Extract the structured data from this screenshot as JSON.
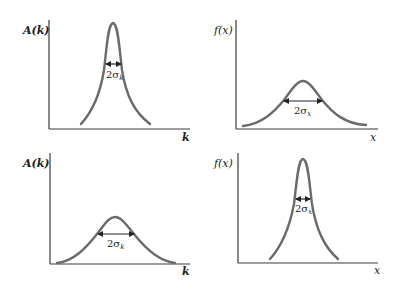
{
  "figure": {
    "curve_color": "#6a6a6a",
    "axis_color": "#3a3a3a",
    "panels": [
      {
        "id": "top-left",
        "y_label": "A(k)",
        "x_label": "k",
        "width_label_main": "2σ",
        "width_label_sub": "k",
        "shape": "narrow"
      },
      {
        "id": "top-right",
        "y_label": "f(x)",
        "x_label": "x",
        "width_label_main": "2σ",
        "width_label_sub": "x",
        "shape": "broad"
      },
      {
        "id": "bottom-left",
        "y_label": "A(k)",
        "x_label": "k",
        "width_label_main": "2σ",
        "width_label_sub": "k",
        "shape": "broad"
      },
      {
        "id": "bottom-right",
        "y_label": "f(x)",
        "x_label": "x",
        "width_label_main": "2σ",
        "width_label_sub": "x",
        "shape": "narrow"
      }
    ]
  }
}
